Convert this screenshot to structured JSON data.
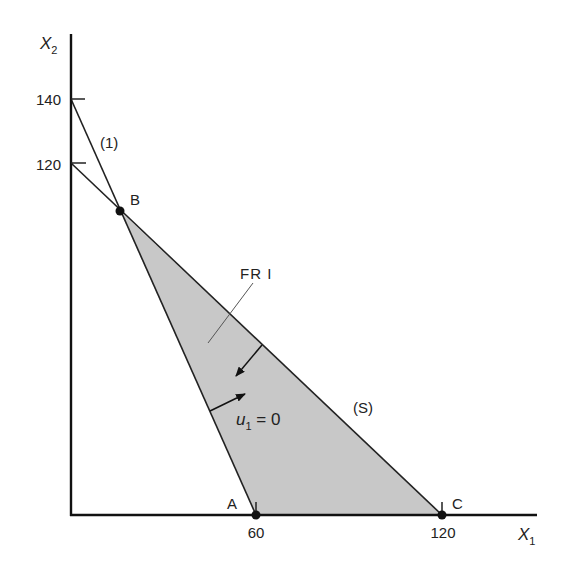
{
  "diagram": {
    "type": "linear-programming feasible region",
    "axes": {
      "x": {
        "label": "X",
        "subscript": "1",
        "ticks": [
          "60",
          "120"
        ]
      },
      "y": {
        "label": "X",
        "subscript": "2",
        "ticks": [
          "120",
          "140"
        ]
      }
    },
    "points": {
      "A": {
        "label": "A",
        "x": 60,
        "y": 0
      },
      "B": {
        "label": "B"
      },
      "C": {
        "label": "C",
        "x": 120,
        "y": 0
      }
    },
    "constraint_labels": {
      "line1": "(1)",
      "lineS": "(S)"
    },
    "region": {
      "label": "FR I",
      "fill": "#c8c8c8"
    },
    "annotation": {
      "var": "u",
      "subscript": "1",
      "rest": " = 0"
    }
  }
}
